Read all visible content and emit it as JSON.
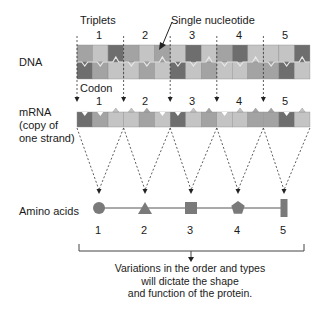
{
  "labels": {
    "triplets": "Triplets",
    "single_nucleotide": "Single nucleotide",
    "dna": "DNA",
    "codon": "Codon",
    "mrna_line1": "mRNA",
    "mrna_line2": "(copy of",
    "mrna_line3": "one strand)",
    "amino_acids": "Amino acids"
  },
  "triplet_numbers": [
    "1",
    "2",
    "3",
    "4",
    "5"
  ],
  "codon_numbers": [
    "1",
    "2",
    "3",
    "4",
    "5"
  ],
  "amino_acid_numbers": [
    "1",
    "2",
    "3",
    "4",
    "5"
  ],
  "amino_acid_shapes": [
    "circle",
    "triangle",
    "square",
    "pentagon",
    "rectangle"
  ],
  "caption": {
    "line1": "Variations in the order and types",
    "line2": "will dictate the shape",
    "line3": "and function of the protein."
  },
  "colors": {
    "light": "#c4c4c4",
    "mid": "#a3a3a3",
    "dark": "#6e6e6e",
    "shape_fill": "#7a7a7a",
    "line": "#444444"
  },
  "dna_top_shades": [
    "mid",
    "light",
    "dark",
    "mid",
    "light",
    "mid",
    "light",
    "dark",
    "light",
    "mid",
    "dark",
    "light",
    "light",
    "light",
    "dark"
  ],
  "dna_bottom_shades": [
    "dark",
    "mid",
    "light",
    "light",
    "mid",
    "light",
    "dark",
    "light",
    "mid",
    "light",
    "light",
    "mid",
    "mid",
    "dark",
    "light"
  ],
  "mrna_shades": [
    "dark",
    "mid",
    "light",
    "light",
    "mid",
    "light",
    "dark",
    "light",
    "mid",
    "light",
    "light",
    "mid",
    "mid",
    "dark",
    "light"
  ]
}
